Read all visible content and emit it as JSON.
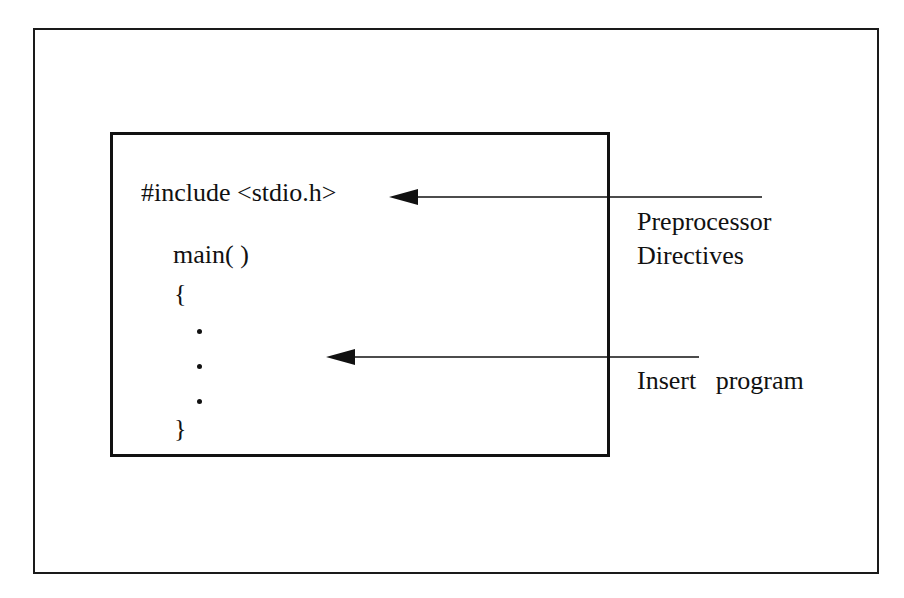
{
  "diagram": {
    "code": {
      "include": "#include <stdio.h>",
      "main": "main( )",
      "open_brace": "{",
      "ellipsis_dots": [
        ".",
        ".",
        "."
      ],
      "close_brace": "}"
    },
    "labels": {
      "preprocessor_line1": "Preprocessor",
      "preprocessor_line2": "Directives",
      "insert_program": "Insert   program"
    },
    "arrows": [
      {
        "from": "Preprocessor Directives label",
        "to": "#include <stdio.h>"
      },
      {
        "from": "Insert program label",
        "to": "program body (dots)"
      }
    ],
    "colors": {
      "stroke": "#111111",
      "background": "#ffffff"
    }
  }
}
